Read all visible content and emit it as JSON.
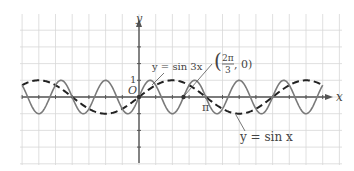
{
  "chart_data": {
    "type": "line",
    "title": "",
    "xlabel": "x",
    "ylabel": "y",
    "x_unit": "pi/4 per grid cell",
    "xlim_in_pi": [
      -1.75,
      2.75
    ],
    "ylim": [
      -1,
      1
    ],
    "grid": true,
    "series": [
      {
        "name": "y = sin x",
        "expr": "sin(x)",
        "style": "dashed",
        "color": "#222222"
      },
      {
        "name": "y = sin 3x",
        "expr": "sin(3x)",
        "style": "solid",
        "color": "#777777"
      }
    ],
    "annotations": [
      {
        "text": "y = sin 3x",
        "points_to": "sin 3x curve near x=π/6"
      },
      {
        "text": "y = sin x",
        "points_to": "sin x curve near x=5π/4"
      },
      {
        "text": "(2π/3, 0)",
        "point": [
          2.0944,
          0
        ],
        "marked": true
      }
    ],
    "tick_labels": {
      "x": [
        "π"
      ],
      "y": [
        "1"
      ],
      "origin": "O"
    }
  },
  "labels": {
    "y_axis": "y",
    "x_axis": "x",
    "origin": "O",
    "one": "1",
    "pi": "π",
    "sin3x": "y = sin 3x",
    "sinx": "y = sin x",
    "point_num": "2π",
    "point_den": "3",
    "point_rest": ", 0)",
    "point_open": "("
  },
  "colors": {
    "grid": "#d8d8d8",
    "axis": "#555555",
    "sinx": "#222222",
    "sin3x": "#7a7a7a",
    "text": "#444444"
  }
}
